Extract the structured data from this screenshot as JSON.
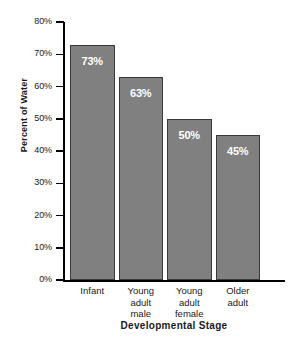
{
  "chart_data": {
    "type": "bar",
    "title": "",
    "xlabel": "Developmental Stage",
    "ylabel": "Percent of Water",
    "categories": [
      "Infant",
      "Young adult male",
      "Young adult female",
      "Older adult"
    ],
    "category_lines": [
      [
        "Infant"
      ],
      [
        "Young",
        "adult",
        "male"
      ],
      [
        "Young",
        "adult",
        "female"
      ],
      [
        "Older",
        "adult"
      ]
    ],
    "values": [
      73,
      63,
      50,
      45
    ],
    "value_labels": [
      "73%",
      "63%",
      "50%",
      "45%"
    ],
    "ylim": [
      0,
      80
    ],
    "ytick_values": [
      80,
      70,
      60,
      50,
      40,
      30,
      20,
      10,
      0
    ],
    "ytick_labels": [
      "80%",
      "70%",
      "60%",
      "50%",
      "40%",
      "30%",
      "20%",
      "10%",
      "0%"
    ],
    "grid": false,
    "legend": "none",
    "colors": {
      "bar_fill": "#808080",
      "bar_border": "#3a3a3a",
      "value_text": "#ffffff",
      "axis": "#000000",
      "background": "#ffffff",
      "text": "#1a1a1a"
    }
  }
}
